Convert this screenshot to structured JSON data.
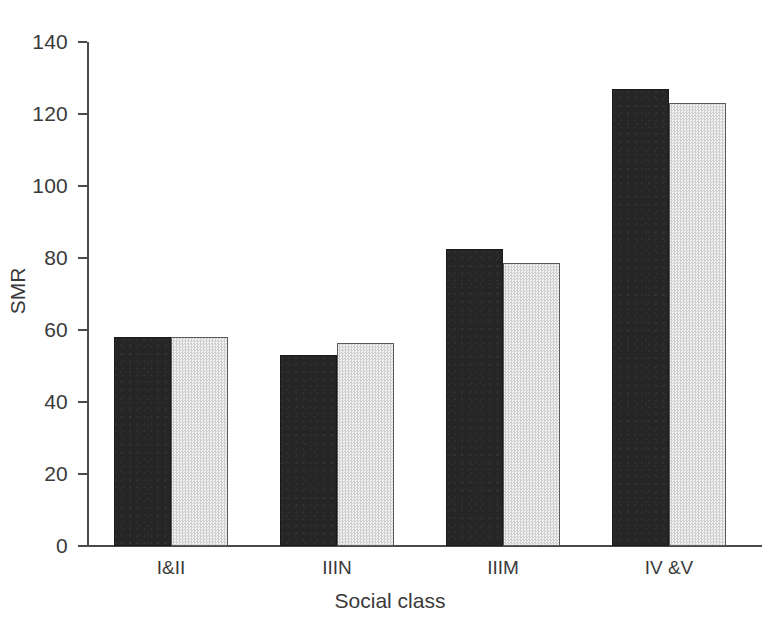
{
  "chart_data": {
    "type": "bar",
    "title": "",
    "xlabel": "Social class",
    "ylabel": "SMR",
    "categories": [
      "I&II",
      "IIIN",
      "IIIM",
      "IV &V"
    ],
    "series": [
      {
        "name": "series-1-dark",
        "values": [
          58,
          53,
          82.5,
          127
        ]
      },
      {
        "name": "series-2-light",
        "values": [
          58,
          56.5,
          78.5,
          123
        ]
      }
    ],
    "ylim": [
      0,
      140
    ],
    "yticks": [
      0,
      20,
      40,
      60,
      80,
      100,
      120,
      140
    ],
    "ytick_labels": [
      "0",
      "20",
      "40",
      "60",
      "80",
      "100",
      "120",
      "140"
    ],
    "grid": false,
    "legend": "none",
    "colors": {
      "series_1": "#262626",
      "series_2": "#e3e3e3",
      "axis": "#4a4a4a",
      "text": "#3a3a3a",
      "background": "#ffffff"
    }
  }
}
